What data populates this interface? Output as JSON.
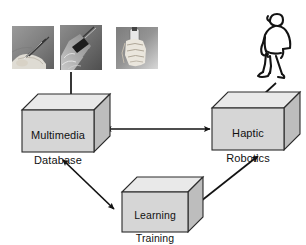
{
  "figure": {
    "type": "block-diagram",
    "background_color": "#ffffff",
    "line_color": "#1a1a1a"
  },
  "nodes": [
    {
      "id": "multimedia-database",
      "label": "Multimedia\nDatabase",
      "shape": "3d-box",
      "face_color": "#d6d6d6",
      "top_color": "#e9e9e9",
      "side_color": "#bdbdbd",
      "x": 22,
      "y": 110,
      "width": 72,
      "height": 42,
      "depth": 16
    },
    {
      "id": "haptic-robotics",
      "label": "Haptic\nRobotics",
      "shape": "3d-box",
      "face_color": "#d6d6d6",
      "top_color": "#e9e9e9",
      "side_color": "#bdbdbd",
      "x": 212,
      "y": 108,
      "width": 72,
      "height": 42,
      "depth": 16
    },
    {
      "id": "learning-training",
      "label": "Learning\nTraining",
      "shape": "3d-box",
      "face_color": "#d6d6d6",
      "top_color": "#e9e9e9",
      "side_color": "#bdbdbd",
      "x": 122,
      "y": 192,
      "width": 66,
      "height": 40,
      "depth": 15
    }
  ],
  "images": [
    {
      "id": "photo-hand-stylus",
      "caption": "hand holding stylus pen",
      "x": 12,
      "y": 26,
      "width": 42,
      "height": 43
    },
    {
      "id": "photo-hand-device",
      "caption": "hand holding handheld device with probe",
      "x": 60,
      "y": 25,
      "width": 42,
      "height": 45
    },
    {
      "id": "photo-hand-tool",
      "caption": "hand gripping cylindrical tool",
      "x": 116,
      "y": 27,
      "width": 42,
      "height": 42
    }
  ],
  "figures": [
    {
      "id": "human-figure",
      "caption": "line-art human figure standing",
      "x": 252,
      "y": 10,
      "width": 44,
      "height": 70
    }
  ],
  "arrows": [
    {
      "id": "photos-to-database",
      "from": "photo-hand-device",
      "to": "multimedia-database",
      "heads": "single",
      "direction": "down"
    },
    {
      "id": "database-to-robotics",
      "from": "multimedia-database",
      "to": "haptic-robotics",
      "heads": "double",
      "direction": "horizontal"
    },
    {
      "id": "database-to-learning",
      "from": "multimedia-database",
      "to": "learning-training",
      "heads": "double",
      "direction": "diagonal-down-right"
    },
    {
      "id": "learning-to-robotics",
      "from": "learning-training",
      "to": "haptic-robotics",
      "heads": "double",
      "direction": "diagonal-up-right"
    },
    {
      "id": "human-to-robotics",
      "from": "human-figure",
      "to": "haptic-robotics",
      "heads": "single",
      "direction": "diagonal-down-left"
    }
  ],
  "labels": {
    "multimedia_line1": "Multimedia",
    "multimedia_line2": "Database",
    "haptic_line1": "Haptic",
    "haptic_line2": "Robotics",
    "learning_line1": "Learning",
    "learning_line2": "Training"
  }
}
